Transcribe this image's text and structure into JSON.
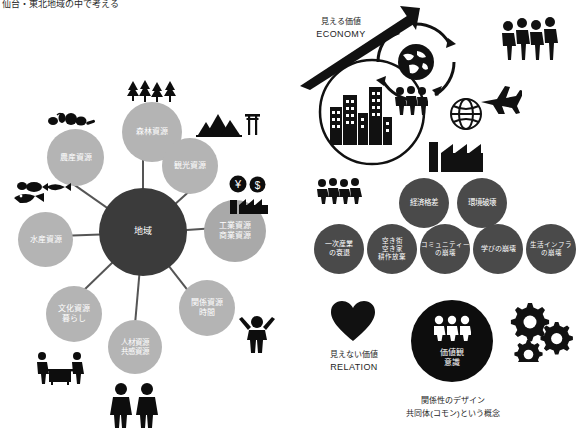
{
  "page": {
    "background_color": "#ffffff",
    "top_fragment": "仙台・東北地域の中で考える"
  },
  "colors": {
    "node_light": "#b4b4b4",
    "node_light2": "#a9a9a9",
    "node_center": "#3b3b3b",
    "node_dark": "#4a4a4a",
    "node_black": "#0d0d0d",
    "line": "#555555",
    "text_on_node": "#ffffff",
    "text_body": "#1e1e1e"
  },
  "left_diagram": {
    "name": "regional-resources-network",
    "center": {
      "label": "地域",
      "icon": "dark-circle"
    },
    "nodes": [
      {
        "id": "forest",
        "label_lines": [
          "森林資源"
        ],
        "icon": "trees-icon"
      },
      {
        "id": "agriculture",
        "label_lines": [
          "農産資源"
        ],
        "icon": "vegetables-icon"
      },
      {
        "id": "tourism",
        "label_lines": [
          "観光資源"
        ],
        "icon": "mountain-torii-icon"
      },
      {
        "id": "fishery",
        "label_lines": [
          "水産資源"
        ],
        "icon": "fish-shrimp-icon"
      },
      {
        "id": "industry",
        "label_lines": [
          "工業資源",
          "商業資源"
        ],
        "icon": "yen-dollar-factory-icon"
      },
      {
        "id": "culture",
        "label_lines": [
          "文化資源",
          "暮らし"
        ],
        "icon": "people-talking-icon"
      },
      {
        "id": "human",
        "label_lines": [
          "人材資源",
          "共感資源"
        ],
        "icon": "two-people-icon"
      },
      {
        "id": "relation",
        "label_lines": [
          "関係資源",
          "時間"
        ],
        "icon": "person-cheering-icon"
      }
    ]
  },
  "right_diagram": {
    "economy": {
      "name": "economy-cluster",
      "jp": "見える価値",
      "en": "ECONOMY",
      "icons": [
        "city-buildings-icon",
        "people-group-icon",
        "globe-icon",
        "airplane-icon",
        "globe-grid-icon",
        "cycle-arrows-icon",
        "up-arrow-icon",
        "people-crowd-icon"
      ]
    },
    "relation": {
      "name": "relation-cluster",
      "jp": "見えない価値",
      "en": "RELATION",
      "icon": "heart-icon"
    },
    "values_circle": {
      "label_lines": [
        "価値観",
        "意識"
      ],
      "icon": "three-people-icon"
    },
    "caption_lines": [
      "関係性のデザイン",
      "共同体(コモン)という概念"
    ],
    "problem_nodes_top": [
      {
        "id": "gap",
        "label_lines": [
          "経済格差"
        ]
      },
      {
        "id": "environment",
        "label_lines": [
          "環境破壊"
        ]
      }
    ],
    "problem_nodes_bottom": [
      {
        "id": "primary-industry",
        "label_lines": [
          "一次産業",
          "の衰退"
        ]
      },
      {
        "id": "vacancy",
        "label_lines": [
          "空き街",
          "空き家",
          "耕作放棄"
        ]
      },
      {
        "id": "community",
        "label_lines": [
          "コミュニティー",
          "の崩壊"
        ]
      },
      {
        "id": "learning",
        "label_lines": [
          "学びの崩壊"
        ]
      },
      {
        "id": "infrastructure",
        "label_lines": [
          "生活インフラ",
          "の崩壊"
        ]
      }
    ],
    "money_icons": {
      "yen": "¥",
      "dollar": "$"
    },
    "gears_icon": "gears-icon"
  }
}
